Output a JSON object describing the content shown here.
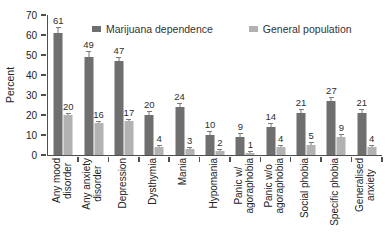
{
  "chart_data": {
    "type": "bar",
    "title": "",
    "xlabel": "",
    "ylabel": "Percent",
    "ylim": [
      0,
      70
    ],
    "yticks": [
      0,
      10,
      20,
      30,
      40,
      50,
      60,
      70
    ],
    "grid": false,
    "legend_position": "top-inside",
    "axis_color": "#4f4f4f",
    "categories": [
      "Any mood\ndisorder",
      "Any anxiety\ndisorder",
      "Depression",
      "Dysthymia",
      "Mania",
      "Hypomania",
      "Panic w/\nagoraphobia",
      "Panic w/o\nagoraphobia",
      "Social phobia",
      "Specific phobia",
      "Generalised\nanxiety"
    ],
    "series": [
      {
        "name": "Marijuana dependence",
        "color": "#6f6f6f",
        "values": [
          61,
          49,
          47,
          20,
          24,
          10,
          9,
          14,
          21,
          27,
          21
        ],
        "errors": [
          3,
          3,
          2,
          2,
          2,
          2,
          2,
          2,
          2,
          2,
          2
        ]
      },
      {
        "name": "General population",
        "color": "#b2b2b2",
        "values": [
          20,
          16,
          17,
          4,
          3,
          2,
          1,
          4,
          5,
          9,
          4
        ],
        "errors": [
          1,
          1,
          1,
          1,
          1,
          1,
          1,
          1,
          1.5,
          1.5,
          1
        ]
      }
    ]
  }
}
